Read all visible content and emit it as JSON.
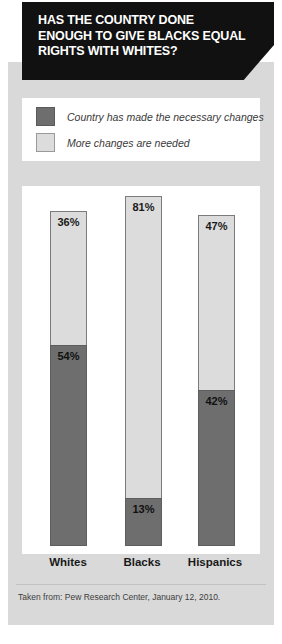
{
  "header": {
    "title": "HAS THE COUNTRY DONE ENOUGH TO GIVE BLACKS EQUAL RIGHTS WITH WHITES?"
  },
  "legend": {
    "items": [
      {
        "label": "Country has made the necessary changes",
        "color": "#6e6e6e",
        "key": "made_changes"
      },
      {
        "label": "More changes are needed",
        "color": "#dcdcdc",
        "key": "more_needed"
      }
    ]
  },
  "footer": {
    "source": "Taken from: Pew Research Center, January 12, 2010."
  },
  "colors": {
    "dark": "#6e6e6e",
    "light": "#dcdcdc",
    "header_bg": "#111111",
    "card_bg": "#d9d9d9",
    "panel_bg": "#ffffff"
  },
  "chart_data": {
    "type": "bar",
    "subtype": "stacked",
    "title": "HAS THE COUNTRY DONE ENOUGH TO GIVE BLACKS EQUAL RIGHTS WITH WHITES?",
    "xlabel": "",
    "ylabel": "",
    "grid": false,
    "legend_position": "top",
    "categories": [
      "Whites",
      "Blacks",
      "Hispanics"
    ],
    "series": [
      {
        "name": "Country has made the necessary changes",
        "color": "#6e6e6e",
        "values": [
          54,
          13,
          42
        ],
        "labels": [
          "54%",
          "13%",
          "42%"
        ]
      },
      {
        "name": "More changes are needed",
        "color": "#dcdcdc",
        "values": [
          36,
          81,
          47
        ],
        "labels": [
          "36%",
          "81%",
          "47%"
        ]
      }
    ],
    "totals": [
      90,
      94,
      89
    ],
    "ylim": [
      0,
      100
    ],
    "units": "percent",
    "source": "Taken from: Pew Research Center, January 12, 2010."
  }
}
